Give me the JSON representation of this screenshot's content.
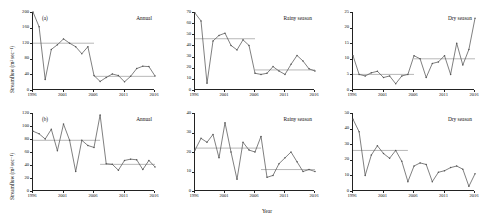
{
  "figure": {
    "axis_titles": {
      "y": "Streamflow (m³ sec⁻¹)",
      "x": "Year"
    },
    "panel_labels": {
      "a": "(a)",
      "b": "(b)"
    },
    "x_ticks": [
      "1996",
      "2001",
      "2006",
      "2011",
      "2016"
    ],
    "x_tick_values": [
      1996,
      2001,
      2006,
      2011,
      2016
    ],
    "line_color": "#555555",
    "mean_line_color": "#999999",
    "axis_color": "#222222"
  },
  "chart_data": [
    {
      "id": "a-annual",
      "type": "line",
      "panel": "(a)",
      "title": "Annual",
      "xlabel": "",
      "ylabel": "Streamflow (m³ sec⁻¹)",
      "xlim": [
        1996,
        2016
      ],
      "ylim": [
        0,
        200
      ],
      "yticks": [
        0,
        40,
        80,
        120,
        160,
        200
      ],
      "xticks": [
        1996,
        2001,
        2006,
        2011,
        2016
      ],
      "grid": false,
      "x": [
        1996,
        1997,
        1998,
        1999,
        2000,
        2001,
        2002,
        2003,
        2004,
        2005,
        2006,
        2007,
        2008,
        2009,
        2010,
        2011,
        2012,
        2013,
        2014,
        2015,
        2016
      ],
      "values": [
        200,
        162,
        27,
        104,
        116,
        131,
        120,
        111,
        93,
        111,
        37,
        22,
        32,
        41,
        37,
        21,
        35,
        55,
        61,
        60,
        36,
        8
      ],
      "segments": [
        {
          "label": "period-1 mean",
          "x_start": 1996,
          "x_end": 2006,
          "value": 120
        },
        {
          "label": "period-2 mean",
          "x_start": 2006,
          "x_end": 2016,
          "value": 35
        }
      ]
    },
    {
      "id": "a-rainy",
      "type": "line",
      "panel": "(a)",
      "title": "Rainy season",
      "xlabel": "",
      "ylabel": "",
      "xlim": [
        1996,
        2016
      ],
      "ylim": [
        0,
        70
      ],
      "yticks": [
        0,
        10,
        20,
        30,
        40,
        50,
        60,
        70
      ],
      "xticks": [
        1996,
        2001,
        2006,
        2011,
        2016
      ],
      "grid": false,
      "x": [
        1996,
        1997,
        1998,
        1999,
        2000,
        2001,
        2002,
        2003,
        2004,
        2005,
        2006,
        2007,
        2008,
        2009,
        2010,
        2011,
        2012,
        2013,
        2014,
        2015,
        2016
      ],
      "values": [
        69,
        62,
        6,
        44,
        49,
        51,
        40,
        36,
        45,
        40,
        15,
        14,
        15,
        21,
        17,
        14,
        23,
        31,
        26,
        19,
        17,
        4
      ],
      "segments": [
        {
          "label": "period-1 mean",
          "x_start": 1996,
          "x_end": 2006,
          "value": 46
        },
        {
          "label": "period-2 mean",
          "x_start": 2006,
          "x_end": 2016,
          "value": 18
        }
      ]
    },
    {
      "id": "a-dry",
      "type": "line",
      "panel": "(a)",
      "title": "Dry season",
      "xlabel": "",
      "ylabel": "",
      "xlim": [
        1996,
        2016
      ],
      "ylim": [
        0,
        25
      ],
      "yticks": [
        0,
        5,
        10,
        15,
        20,
        25
      ],
      "xticks": [
        1996,
        2001,
        2006,
        2011,
        2016
      ],
      "grid": false,
      "x": [
        1996,
        1997,
        1998,
        1999,
        2000,
        2001,
        2002,
        2003,
        2004,
        2005,
        2006,
        2007,
        2008,
        2009,
        2010,
        2011,
        2012,
        2013,
        2014,
        2015,
        2016
      ],
      "values": [
        11,
        5,
        4.5,
        5.5,
        6,
        4,
        4.5,
        2,
        4.5,
        5,
        11,
        10,
        4,
        8.5,
        9,
        11,
        5,
        15,
        8,
        13,
        23
      ],
      "segments": [
        {
          "label": "period-1 mean",
          "x_start": 1996,
          "x_end": 2006,
          "value": 5
        },
        {
          "label": "period-2 mean",
          "x_start": 2006,
          "x_end": 2016,
          "value": 10
        }
      ]
    },
    {
      "id": "b-annual",
      "type": "line",
      "panel": "(b)",
      "title": "Annual",
      "xlabel": "",
      "ylabel": "Streamflow (m³ sec⁻¹)",
      "xlim": [
        1996,
        2016
      ],
      "ylim": [
        0,
        120
      ],
      "yticks": [
        0,
        20,
        40,
        60,
        80,
        100,
        120
      ],
      "xticks": [
        1996,
        2001,
        2006,
        2011,
        2016
      ],
      "grid": false,
      "x": [
        1996,
        1997,
        1998,
        1999,
        2000,
        2001,
        2002,
        2003,
        2004,
        2005,
        2006,
        2007,
        2008,
        2009,
        2010,
        2011,
        2012,
        2013,
        2014,
        2015,
        2016
      ],
      "values": [
        92,
        88,
        80,
        95,
        62,
        103,
        78,
        30,
        78,
        70,
        67,
        117,
        42,
        41,
        32,
        47,
        49,
        48,
        33,
        47,
        37,
        53
      ],
      "segments": [
        {
          "label": "period-1 mean",
          "x_start": 1996,
          "x_end": 2007,
          "value": 78
        },
        {
          "label": "period-2 mean",
          "x_start": 2007,
          "x_end": 2016,
          "value": 41
        }
      ]
    },
    {
      "id": "b-rainy",
      "type": "line",
      "panel": "(b)",
      "title": "Rainy season",
      "xlabel": "Year",
      "ylabel": "",
      "xlim": [
        1996,
        2016
      ],
      "ylim": [
        0,
        40
      ],
      "yticks": [
        0,
        10,
        20,
        30,
        40
      ],
      "xticks": [
        1996,
        2001,
        2006,
        2011,
        2016
      ],
      "grid": false,
      "x": [
        1996,
        1997,
        1998,
        1999,
        2000,
        2001,
        2002,
        2003,
        2004,
        2005,
        2006,
        2007,
        2008,
        2009,
        2010,
        2011,
        2012,
        2013,
        2014,
        2015,
        2016
      ],
      "values": [
        21,
        27,
        25,
        29,
        17,
        35,
        20,
        6,
        25,
        21,
        20,
        28,
        7,
        8,
        14,
        17,
        20,
        15,
        10,
        11,
        10,
        11
      ],
      "segments": [
        {
          "label": "period-1 mean",
          "x_start": 1996,
          "x_end": 2007,
          "value": 22
        },
        {
          "label": "period-2 mean",
          "x_start": 2007,
          "x_end": 2016,
          "value": 11
        }
      ]
    },
    {
      "id": "b-dry",
      "type": "line",
      "panel": "(b)",
      "title": "Dry season",
      "xlabel": "",
      "ylabel": "",
      "xlim": [
        1996,
        2016
      ],
      "ylim": [
        0,
        50
      ],
      "yticks": [
        0,
        10,
        20,
        30,
        40,
        50
      ],
      "xticks": [
        1996,
        2001,
        2006,
        2011,
        2016
      ],
      "grid": false,
      "x": [
        1996,
        1997,
        1998,
        1999,
        2000,
        2001,
        2002,
        2003,
        2004,
        2005,
        2006,
        2007,
        2008,
        2009,
        2010,
        2011,
        2012,
        2013,
        2014,
        2015,
        2016
      ],
      "values": [
        46,
        38,
        10,
        23,
        29,
        24,
        21,
        26,
        19,
        6,
        16,
        18,
        17,
        6,
        12,
        13,
        15,
        16,
        14,
        3,
        11
      ],
      "segments": [
        {
          "label": "period-1 mean",
          "x_start": 1996,
          "x_end": 2005,
          "value": 26
        }
      ]
    }
  ]
}
